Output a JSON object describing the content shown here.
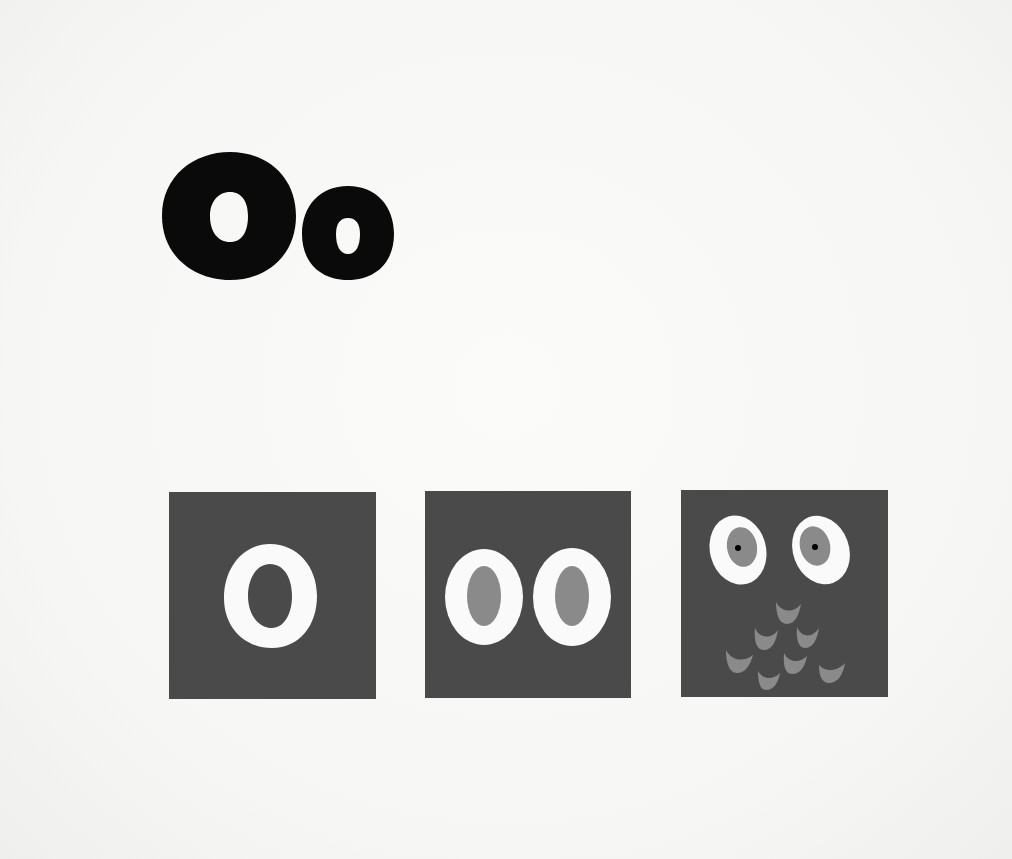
{
  "page": {
    "heading": {
      "uppercase": "O",
      "lowercase": "o",
      "text": "Oo",
      "color": "#0a0a0a"
    },
    "cards": [
      {
        "name": "letter-o-card",
        "description": "White letter O on dark gray square",
        "background": "#4a4a4a",
        "ring_color": "#fafafa"
      },
      {
        "name": "two-eyes-card",
        "description": "Two white ovals with gray pupils",
        "background": "#4a4a4a",
        "ring_color": "#fafafa",
        "pupil_color": "#8a8a8a"
      },
      {
        "name": "owl-card",
        "description": "Owl face: two eyes with gray irises and black pupils, plus gray feather scallops",
        "background": "#4a4a4a",
        "ring_color": "#fafafa",
        "iris_color": "#8a8a8a",
        "pupil_dot_color": "#000000",
        "feather_color": "#8a8a8a",
        "feather_count": 8
      }
    ]
  }
}
